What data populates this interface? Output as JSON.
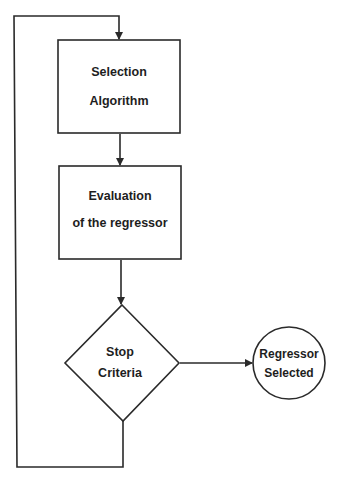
{
  "diagram": {
    "type": "flowchart",
    "nodes": [
      {
        "id": "selection",
        "shape": "rectangle",
        "lines": [
          "Selection",
          "Algorithm"
        ]
      },
      {
        "id": "evaluation",
        "shape": "rectangle",
        "lines": [
          "Evaluation",
          "of the regressor"
        ]
      },
      {
        "id": "stop",
        "shape": "diamond",
        "lines": [
          "Stop",
          "Criteria"
        ]
      },
      {
        "id": "selected",
        "shape": "circle",
        "lines": [
          "Regressor",
          "Selected"
        ]
      }
    ],
    "edges": [
      {
        "from": "selection",
        "to": "evaluation"
      },
      {
        "from": "evaluation",
        "to": "stop"
      },
      {
        "from": "stop",
        "to": "selected"
      },
      {
        "from": "stop",
        "to": "selection",
        "route": "loop-back-left"
      }
    ],
    "colors": {
      "line": "#2a2a2a",
      "text": "#1e1e1e",
      "background": "#ffffff"
    }
  }
}
